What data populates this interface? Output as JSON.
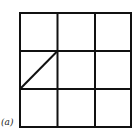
{
  "figure": {
    "label": "(a)",
    "grid": {
      "rows": 3,
      "cols": 3,
      "x_lines": [
        20,
        57.5,
        95,
        131
      ],
      "y_lines": [
        13,
        51,
        89,
        127
      ],
      "stroke_color": "#111111",
      "stroke_width": 2
    },
    "diagonal": {
      "from": [
        20,
        89
      ],
      "to": [
        57.5,
        51
      ],
      "cell": "middle-left",
      "direction": "bottom-left to top-right"
    }
  }
}
